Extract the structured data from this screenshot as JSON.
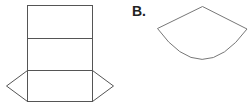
{
  "figures": {
    "a": {
      "description": "net of a triangular prism",
      "stroke": "#555555",
      "rect_x": [
        27,
        92
      ],
      "rows_y": [
        5,
        38,
        70,
        101
      ],
      "left_apex": [
        6,
        86
      ],
      "right_apex": [
        113,
        86
      ]
    },
    "b": {
      "label": "B.",
      "description": "circular sector (cone net)",
      "stroke": "#777777",
      "apex": [
        202,
        6
      ],
      "left_end": [
        157,
        28
      ],
      "right_end": [
        247,
        29
      ]
    }
  }
}
